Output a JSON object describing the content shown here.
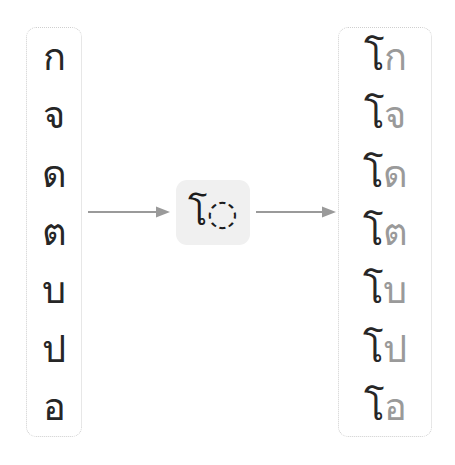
{
  "diagram": {
    "type": "transformation-rule",
    "script": "Thai",
    "colors": {
      "text_dark": "#262626",
      "text_gray": "#9a9a9a",
      "arrow": "#9a9a9a",
      "rule_box_bg": "#f0f0f0",
      "box_border": "#cfcfcf",
      "background": "#ffffff"
    }
  },
  "input": {
    "name": "input-consonants",
    "items": [
      {
        "char": "ก"
      },
      {
        "char": "จ"
      },
      {
        "char": "ด"
      },
      {
        "char": "ต"
      },
      {
        "char": "บ"
      },
      {
        "char": "ป"
      },
      {
        "char": "อ"
      }
    ]
  },
  "rule": {
    "name": "vowel-prefix-rule",
    "vowel": "โ",
    "placeholder": "◌",
    "display": "โ◌"
  },
  "arrows": [
    {
      "name": "arrow-input-to-rule",
      "direction": "right"
    },
    {
      "name": "arrow-rule-to-output",
      "direction": "right"
    }
  ],
  "output": {
    "name": "output-syllables",
    "items": [
      {
        "vowel": "โ",
        "consonant": "ก",
        "full": "โก"
      },
      {
        "vowel": "โ",
        "consonant": "จ",
        "full": "โจ"
      },
      {
        "vowel": "โ",
        "consonant": "ด",
        "full": "โด"
      },
      {
        "vowel": "โ",
        "consonant": "ต",
        "full": "โต"
      },
      {
        "vowel": "โ",
        "consonant": "บ",
        "full": "โบ"
      },
      {
        "vowel": "โ",
        "consonant": "ป",
        "full": "โป"
      },
      {
        "vowel": "โ",
        "consonant": "อ",
        "full": "โอ"
      }
    ]
  }
}
